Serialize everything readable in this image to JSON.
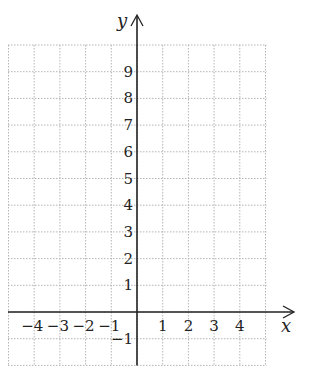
{
  "diagram": {
    "type": "coordinate-grid",
    "axes": {
      "x_label": "x",
      "y_label": "y"
    },
    "x_range": [
      -5,
      5
    ],
    "y_range": [
      -2,
      10
    ],
    "x_tick_labels": [
      "−4",
      "−3",
      "−2",
      "−1",
      "1",
      "2",
      "3",
      "4"
    ],
    "x_tick_values": [
      -4,
      -3,
      -2,
      -1,
      1,
      2,
      3,
      4
    ],
    "y_tick_labels": [
      "9",
      "8",
      "7",
      "6",
      "5",
      "4",
      "3",
      "2",
      "1",
      "−1"
    ],
    "y_tick_values": [
      9,
      8,
      7,
      6,
      5,
      4,
      3,
      2,
      1,
      -1
    ],
    "colors": {
      "grid": "#b5b5b5",
      "axis": "#222222",
      "text": "#222222"
    }
  }
}
